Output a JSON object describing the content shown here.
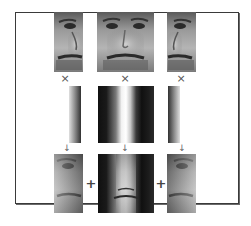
{
  "diagram": {
    "top_row": {
      "images": [
        {
          "id": "left-face",
          "label": "left half face crop"
        },
        {
          "id": "center-face",
          "label": "full face crop"
        },
        {
          "id": "right-face",
          "label": "right half face crop"
        }
      ]
    },
    "operators": {
      "multiply": "×",
      "arrow": "↓",
      "plus": "+"
    },
    "weight_strips": [
      {
        "id": "left-weight",
        "pattern": "light-to-dark horizontal gradient"
      },
      {
        "id": "center-weight",
        "pattern": "dark-light-dark bands with bright center"
      },
      {
        "id": "right-weight",
        "pattern": "dark-to-light horizontal gradient"
      }
    ],
    "bottom_row": {
      "images": [
        {
          "id": "weighted-left",
          "label": "weighted left face"
        },
        {
          "id": "weighted-center",
          "label": "weighted center face"
        },
        {
          "id": "weighted-right",
          "label": "weighted right face"
        }
      ]
    },
    "colors": {
      "frame_border": "#3a3a3a",
      "background": "#ffffff",
      "operator": "#555555"
    }
  }
}
